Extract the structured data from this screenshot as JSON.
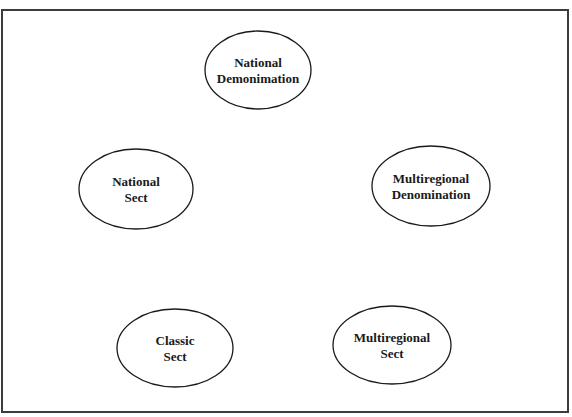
{
  "diagram": {
    "frame": {
      "x": 1,
      "y": 9,
      "width": 566,
      "height": 402,
      "border_color": "#3c3c3c"
    },
    "nodes": [
      {
        "id": "national-denomination",
        "lines": [
          "National",
          "Demonimation"
        ],
        "cx": 258,
        "cy": 70,
        "rx": 53,
        "ry": 39
      },
      {
        "id": "national-sect",
        "lines": [
          "National",
          "Sect"
        ],
        "cx": 136,
        "cy": 189,
        "rx": 57,
        "ry": 40
      },
      {
        "id": "multiregional-denomination",
        "lines": [
          "Multiregional",
          "Denomination"
        ],
        "cx": 431,
        "cy": 186,
        "rx": 59,
        "ry": 40
      },
      {
        "id": "classic-sect",
        "lines": [
          "Classic",
          "Sect"
        ],
        "cx": 175,
        "cy": 348,
        "rx": 58,
        "ry": 39
      },
      {
        "id": "multiregional-sect",
        "lines": [
          "Multiregional",
          "Sect"
        ],
        "cx": 392,
        "cy": 345,
        "rx": 59,
        "ry": 39
      }
    ],
    "edges": []
  }
}
